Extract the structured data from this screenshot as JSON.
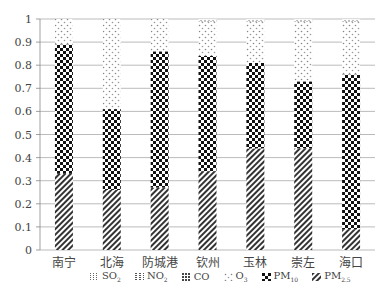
{
  "chart_data": {
    "type": "bar",
    "stacked": true,
    "title": "",
    "xlabel": "",
    "ylabel": "",
    "ylim": [
      0,
      1
    ],
    "yticks": [
      "0",
      "0.1",
      "0.2",
      "0.3",
      "0.4",
      "0.5",
      "0.6",
      "0.7",
      "0.8",
      "0.9",
      "1"
    ],
    "grid": true,
    "legend_position": "bottom",
    "categories": [
      "南宁",
      "北海",
      "防城港",
      "钦州",
      "玉林",
      "崇左",
      "海口"
    ],
    "series": [
      {
        "name": "PM2.5",
        "label": "PM",
        "sub": "2.5",
        "pattern": "diag",
        "values": [
          0.33,
          0.26,
          0.27,
          0.34,
          0.44,
          0.44,
          0.09
        ]
      },
      {
        "name": "PM10",
        "label": "PM",
        "sub": "10",
        "pattern": "checker",
        "values": [
          0.56,
          0.35,
          0.59,
          0.5,
          0.37,
          0.29,
          0.67
        ]
      },
      {
        "name": "O3",
        "label": "O",
        "sub": "3",
        "pattern": "dots",
        "values": [
          0.11,
          0.39,
          0.14,
          0.15,
          0.18,
          0.26,
          0.23
        ]
      },
      {
        "name": "CO",
        "label": "CO",
        "sub": "",
        "pattern": "grid",
        "values": [
          0.0,
          0.0,
          0.0,
          0.004,
          0.004,
          0.004,
          0.004
        ]
      },
      {
        "name": "NO2",
        "label": "NO",
        "sub": "2",
        "pattern": "dash",
        "values": [
          0.0,
          0.0,
          0.0,
          0.003,
          0.003,
          0.003,
          0.003
        ]
      },
      {
        "name": "SO2",
        "label": "SO",
        "sub": "2",
        "pattern": "wave",
        "values": [
          0.0,
          0.0,
          0.0,
          0.003,
          0.003,
          0.003,
          0.003
        ]
      }
    ],
    "legend_order": [
      "SO2",
      "NO2",
      "CO",
      "O3",
      "PM10",
      "PM2.5"
    ]
  }
}
